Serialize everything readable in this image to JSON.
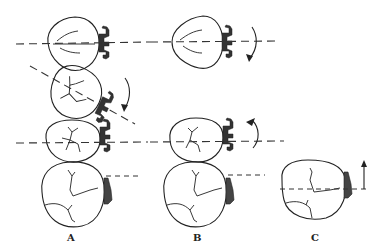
{
  "figure": {
    "panels": [
      {
        "id": "A",
        "label": "A",
        "description": "Four teeth stacked vertically; top premolar with bracket on horizontal axis, tilted tooth with bracket on rotated axis and clockwise rotation arrow, molar with bracket on horizontal axis, bottom molar with attachment"
      },
      {
        "id": "B",
        "label": "B",
        "description": "Premolar with bracket and curved rotation arrow, molar with bracket and counterclockwise rotation arrow, bottom molar with attachment"
      },
      {
        "id": "C",
        "label": "C",
        "description": "Single molar with attachment and upward vertical arrow"
      }
    ],
    "colors": {
      "line": "#222222",
      "bracket": "#333333",
      "background": "#ffffff"
    }
  }
}
